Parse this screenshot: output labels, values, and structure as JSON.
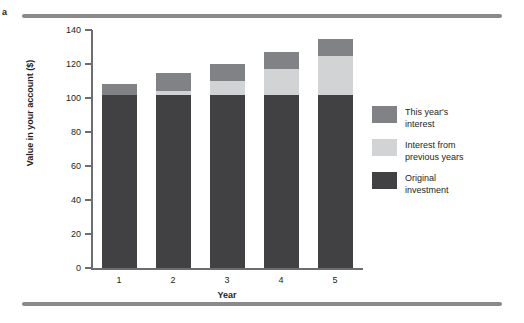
{
  "panel": {
    "letter": "a"
  },
  "chart_data": {
    "type": "bar",
    "stacked": true,
    "title": "",
    "xlabel": "Year",
    "ylabel": "Value in your account ($)",
    "categories": [
      "1",
      "2",
      "3",
      "4",
      "5"
    ],
    "x_tick_labels": [
      "1",
      "2",
      "3",
      "4",
      "5"
    ],
    "y_tick_labels": [
      "0",
      "20",
      "40",
      "60",
      "80",
      "100",
      "120",
      "140"
    ],
    "y_ticks": [
      0,
      20,
      40,
      60,
      80,
      100,
      120,
      140
    ],
    "ylim": [
      0,
      140
    ],
    "grid": false,
    "legend_position": "right",
    "series": [
      {
        "name": "Original investment",
        "color": "#414042",
        "values": [
          102,
          102,
          102,
          102,
          102
        ]
      },
      {
        "name": "Interest from previous years",
        "color": "#d1d3d4",
        "values": [
          0,
          2,
          8,
          15,
          23
        ]
      },
      {
        "name": "This year's interest",
        "color": "#808285",
        "values": [
          6,
          11,
          10,
          10,
          10
        ]
      }
    ],
    "bar_totals": [
      108,
      115,
      120,
      127,
      135
    ],
    "legend_entries": [
      {
        "label": "This year's\ninterest",
        "color": "#808285"
      },
      {
        "label": "Interest from\nprevious years",
        "color": "#d1d3d4"
      },
      {
        "label": "Original\ninvestment",
        "color": "#414042"
      }
    ]
  },
  "colors": {
    "rule": "#8a8a8a",
    "axis": "#6d6d6d",
    "text": "#231f20"
  }
}
